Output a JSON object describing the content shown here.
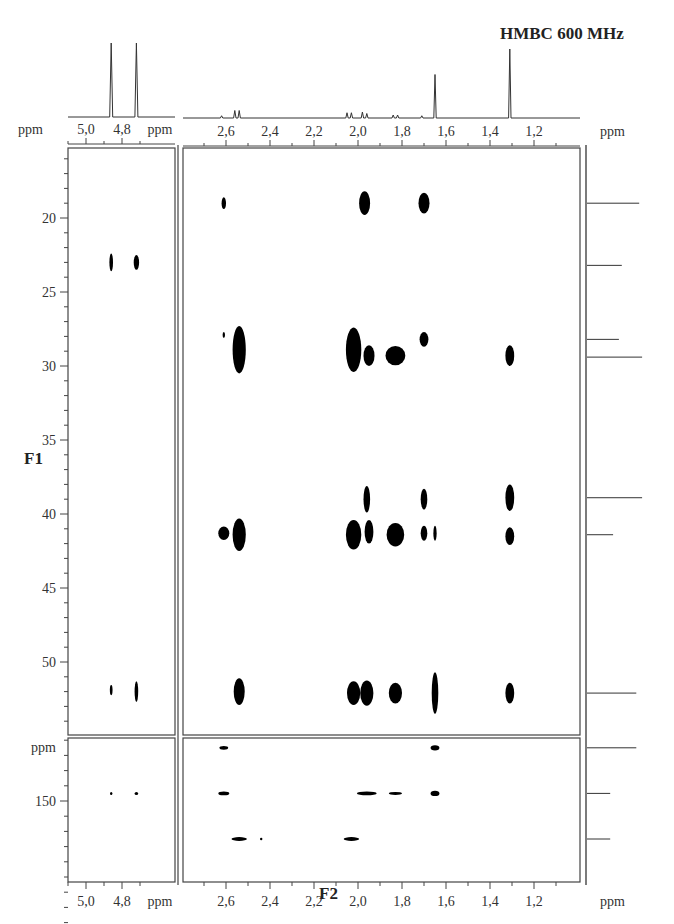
{
  "title": "HMBC 600 MHz",
  "axes": {
    "f1_label": "F1",
    "f2_label": "F2",
    "unit": "ppm",
    "f2_ticks_main": [
      "2,6",
      "2,4",
      "2,2",
      "2,0",
      "1,8",
      "1,6",
      "1,4",
      "1,2"
    ],
    "f2_ticks_left": [
      "5,0",
      "4,8"
    ],
    "f1_ticks_main": [
      "20",
      "25",
      "30",
      "35",
      "40",
      "45",
      "50"
    ],
    "f1_ticks_lower": [
      "150"
    ]
  },
  "chart_data": {
    "type": "scatter",
    "title": "HMBC 600 MHz",
    "xlabel": "F2 (ppm)",
    "ylabel": "F1 (ppm)",
    "x_reversed": true,
    "y_reversed": true,
    "panels": [
      {
        "name": "main-aliphatic",
        "xlim": [
          2.8,
          1.0
        ],
        "ylim": [
          15.3,
          54.9
        ],
        "x_ticks": [
          2.6,
          2.4,
          2.2,
          2.0,
          1.8,
          1.6,
          1.4,
          1.2
        ],
        "y_ticks": [
          20,
          25,
          30,
          35,
          40,
          45,
          50
        ],
        "cross_peaks": [
          {
            "f2": 2.61,
            "f1": 19.0,
            "w": 0.02,
            "h": 0.8
          },
          {
            "f2": 1.97,
            "f1": 19.0,
            "w": 0.05,
            "h": 1.6
          },
          {
            "f2": 1.7,
            "f1": 19.0,
            "w": 0.05,
            "h": 1.4
          },
          {
            "f2": 2.61,
            "f1": 27.9,
            "w": 0.01,
            "h": 0.4
          },
          {
            "f2": 2.54,
            "f1": 28.9,
            "w": 0.06,
            "h": 3.2
          },
          {
            "f2": 2.02,
            "f1": 28.9,
            "w": 0.07,
            "h": 3.0
          },
          {
            "f2": 1.95,
            "f1": 29.3,
            "w": 0.05,
            "h": 1.4
          },
          {
            "f2": 1.83,
            "f1": 29.3,
            "w": 0.09,
            "h": 1.3
          },
          {
            "f2": 1.7,
            "f1": 28.2,
            "w": 0.04,
            "h": 1.0
          },
          {
            "f2": 1.31,
            "f1": 29.3,
            "w": 0.04,
            "h": 1.4
          },
          {
            "f2": 1.96,
            "f1": 39.0,
            "w": 0.03,
            "h": 1.8
          },
          {
            "f2": 1.7,
            "f1": 39.0,
            "w": 0.03,
            "h": 1.4
          },
          {
            "f2": 1.31,
            "f1": 38.9,
            "w": 0.04,
            "h": 1.8
          },
          {
            "f2": 2.61,
            "f1": 41.3,
            "w": 0.05,
            "h": 0.9
          },
          {
            "f2": 2.54,
            "f1": 41.4,
            "w": 0.06,
            "h": 2.2
          },
          {
            "f2": 2.02,
            "f1": 41.4,
            "w": 0.07,
            "h": 2.0
          },
          {
            "f2": 1.95,
            "f1": 41.2,
            "w": 0.04,
            "h": 1.6
          },
          {
            "f2": 1.83,
            "f1": 41.4,
            "w": 0.08,
            "h": 1.6
          },
          {
            "f2": 1.7,
            "f1": 41.3,
            "w": 0.03,
            "h": 1.0
          },
          {
            "f2": 1.65,
            "f1": 41.3,
            "w": 0.015,
            "h": 1.0
          },
          {
            "f2": 1.31,
            "f1": 41.5,
            "w": 0.04,
            "h": 1.2
          },
          {
            "f2": 2.54,
            "f1": 52.0,
            "w": 0.05,
            "h": 1.8
          },
          {
            "f2": 2.02,
            "f1": 52.1,
            "w": 0.06,
            "h": 1.6
          },
          {
            "f2": 1.96,
            "f1": 52.1,
            "w": 0.06,
            "h": 1.7
          },
          {
            "f2": 1.83,
            "f1": 52.1,
            "w": 0.06,
            "h": 1.4
          },
          {
            "f2": 1.65,
            "f1": 52.1,
            "w": 0.03,
            "h": 2.8
          },
          {
            "f2": 1.31,
            "f1": 52.1,
            "w": 0.04,
            "h": 1.4
          }
        ]
      },
      {
        "name": "left-olefinic",
        "xlim": [
          5.1,
          4.7
        ],
        "ylim": [
          15.3,
          54.9
        ],
        "x_ticks": [
          5.0,
          4.8
        ],
        "cross_peaks": [
          {
            "f2": 4.86,
            "f1": 23.0,
            "w": 0.02,
            "h": 1.2
          },
          {
            "f2": 4.72,
            "f1": 23.0,
            "w": 0.03,
            "h": 1.0
          },
          {
            "f2": 4.86,
            "f1": 51.9,
            "w": 0.015,
            "h": 0.7
          },
          {
            "f2": 4.72,
            "f1": 52.0,
            "w": 0.02,
            "h": 1.4
          }
        ]
      },
      {
        "name": "lower-main",
        "xlim": [
          2.8,
          1.0
        ],
        "ylim": [
          140,
          168
        ],
        "y_ticks": [
          150
        ],
        "cross_peaks": [
          {
            "f2": 2.61,
            "f1": 143.0,
            "w": 0.04,
            "h": 0.5
          },
          {
            "f2": 2.61,
            "f1": 149.0,
            "w": 0.05,
            "h": 0.5
          },
          {
            "f2": 1.96,
            "f1": 149.0,
            "w": 0.09,
            "h": 0.5
          },
          {
            "f2": 1.83,
            "f1": 149.0,
            "w": 0.06,
            "h": 0.4
          },
          {
            "f2": 1.65,
            "f1": 143.0,
            "w": 0.04,
            "h": 0.7
          },
          {
            "f2": 1.65,
            "f1": 149.0,
            "w": 0.04,
            "h": 0.7
          },
          {
            "f2": 2.54,
            "f1": 155.0,
            "w": 0.07,
            "h": 0.5
          },
          {
            "f2": 2.44,
            "f1": 155.0,
            "w": 0.005,
            "h": 0.3
          },
          {
            "f2": 2.03,
            "f1": 155.0,
            "w": 0.07,
            "h": 0.5
          }
        ]
      },
      {
        "name": "lower-left",
        "xlim": [
          5.1,
          4.7
        ],
        "ylim": [
          140,
          168
        ],
        "x_ticks": [
          5.0,
          4.8
        ],
        "cross_peaks": [
          {
            "f2": 4.86,
            "f1": 149.0,
            "w": 0.01,
            "h": 0.4
          },
          {
            "f2": 4.72,
            "f1": 149.0,
            "w": 0.02,
            "h": 0.4
          }
        ]
      }
    ],
    "f2_projection": {
      "peaks": [
        {
          "ppm": 4.86,
          "height": 1.0
        },
        {
          "ppm": 4.72,
          "height": 1.0
        },
        {
          "ppm": 2.62,
          "height": 0.03
        },
        {
          "ppm": 2.56,
          "height": 0.1
        },
        {
          "ppm": 2.54,
          "height": 0.1
        },
        {
          "ppm": 2.05,
          "height": 0.07
        },
        {
          "ppm": 2.03,
          "height": 0.07
        },
        {
          "ppm": 1.98,
          "height": 0.08
        },
        {
          "ppm": 1.96,
          "height": 0.06
        },
        {
          "ppm": 1.84,
          "height": 0.04
        },
        {
          "ppm": 1.82,
          "height": 0.04
        },
        {
          "ppm": 1.71,
          "height": 0.03
        },
        {
          "ppm": 1.65,
          "height": 0.58
        },
        {
          "ppm": 1.31,
          "height": 0.92
        }
      ]
    },
    "f1_projection": {
      "peaks": [
        {
          "ppm": 19.0,
          "height": 0.9
        },
        {
          "ppm": 23.2,
          "height": 0.6
        },
        {
          "ppm": 28.2,
          "height": 0.55
        },
        {
          "ppm": 29.4,
          "height": 0.95
        },
        {
          "ppm": 38.9,
          "height": 0.95
        },
        {
          "ppm": 41.4,
          "height": 0.45
        },
        {
          "ppm": 52.1,
          "height": 0.85
        },
        {
          "ppm": 143.0,
          "height": 0.85
        },
        {
          "ppm": 149.0,
          "height": 0.4
        },
        {
          "ppm": 155.0,
          "height": 0.4
        }
      ]
    }
  }
}
